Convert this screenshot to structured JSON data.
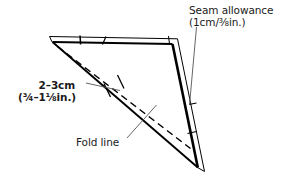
{
  "figure": {
    "type": "sewing-pattern-diagram",
    "width": 289,
    "height": 178,
    "background_color": "#ffffff",
    "line_color": "#000000",
    "text_color": "#1a1a1a"
  },
  "labels": {
    "seam_allowance": {
      "line1": "Seam allowance",
      "line2": "(1cm/⅜in.)",
      "measurement_metric": "1cm",
      "measurement_imperial": "⅜in."
    },
    "measure": {
      "line1": "2–3cm",
      "line2": "(¾–1⅛in.)",
      "measurement_metric": "2–3cm",
      "measurement_imperial": "¾–1⅛in."
    },
    "fold_line": {
      "text": "Fold line"
    }
  },
  "geometry": {
    "outline_points": "52,42 172,44 198,167",
    "fold_line_points": "58,47 190,148",
    "seam_outer_top": "50,37 176,39",
    "seam_outer_right": "178,40 203,170",
    "leader_seam": "196,28 189,106",
    "leader_fold": "126,139 156,106",
    "leader_measure": "86,84 117,89"
  }
}
